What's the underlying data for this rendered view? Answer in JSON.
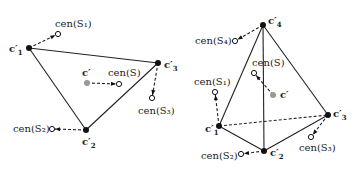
{
  "left": {
    "vertices": [
      {
        "id": "c1",
        "label": "c",
        "sub": "1",
        "x": 29,
        "y": 48
      },
      {
        "id": "c3",
        "label": "c",
        "sub": "3",
        "x": 158,
        "y": 63
      },
      {
        "id": "c2",
        "label": "c",
        "sub": "2",
        "x": 86,
        "y": 130
      }
    ],
    "centroid": {
      "label": "c′",
      "x": 87,
      "y": 83
    },
    "cen": [
      {
        "label": "cen(S₁)",
        "x": 58,
        "y": 34,
        "from": [
          29,
          48
        ],
        "lx": 55,
        "ly": 19
      },
      {
        "label": "cen(S₃)",
        "x": 152,
        "y": 98,
        "from": [
          158,
          63
        ],
        "lx": 138,
        "ly": 106
      },
      {
        "label": "cen(S₂)",
        "x": 52,
        "y": 129,
        "from": [
          86,
          130
        ],
        "lx": 13,
        "ly": 124
      },
      {
        "label": "cen(S)",
        "x": 119,
        "y": 84,
        "from": [
          87,
          83
        ],
        "lx": 108,
        "ly": 68
      }
    ]
  },
  "right": {
    "vertices": [
      {
        "id": "c4",
        "label": "c",
        "sub": "4",
        "x": 263,
        "y": 25
      },
      {
        "id": "c3",
        "label": "c",
        "sub": "3",
        "x": 328,
        "y": 115
      },
      {
        "id": "c1",
        "label": "c",
        "sub": "1",
        "x": 219,
        "y": 126
      },
      {
        "id": "c2",
        "label": "c",
        "sub": "2",
        "x": 264,
        "y": 151
      }
    ],
    "centroid": {
      "label": "c′",
      "x": 273,
      "y": 95
    },
    "cen": [
      {
        "label": "cen(S₄)",
        "x": 235,
        "y": 41,
        "from": [
          263,
          25
        ],
        "lx": 195,
        "ly": 36
      },
      {
        "label": "cen(S)",
        "x": 254,
        "y": 73,
        "from": [
          273,
          95
        ],
        "lx": 252,
        "ly": 58
      },
      {
        "label": "cen(S₁)",
        "x": 215,
        "y": 92,
        "from": [
          219,
          126
        ],
        "lx": 194,
        "ly": 77
      },
      {
        "label": "cen(S₃)",
        "x": 311,
        "y": 137,
        "from": [
          328,
          115
        ],
        "lx": 299,
        "ly": 143
      },
      {
        "label": "cen(S₂)",
        "x": 241,
        "y": 154,
        "from": [
          264,
          151
        ],
        "lx": 201,
        "ly": 151
      }
    ]
  },
  "vertex_labels": {
    "left": [
      {
        "text": "c",
        "sub": "1",
        "x": 9,
        "y": 44
      },
      {
        "text": "c",
        "sub": "3",
        "x": 164,
        "y": 60
      },
      {
        "text": "c",
        "sub": "2",
        "x": 82,
        "y": 137
      },
      {
        "text": "c′",
        "sub": "",
        "x": 82,
        "y": 68
      }
    ],
    "right": [
      {
        "text": "c",
        "sub": "4",
        "x": 268,
        "y": 16
      },
      {
        "text": "c",
        "sub": "3",
        "x": 333,
        "y": 109
      },
      {
        "text": "c",
        "sub": "1",
        "x": 205,
        "y": 124
      },
      {
        "text": "c",
        "sub": "2",
        "x": 270,
        "y": 148
      },
      {
        "text": "c′",
        "sub": "",
        "x": 280,
        "y": 90
      }
    ]
  }
}
